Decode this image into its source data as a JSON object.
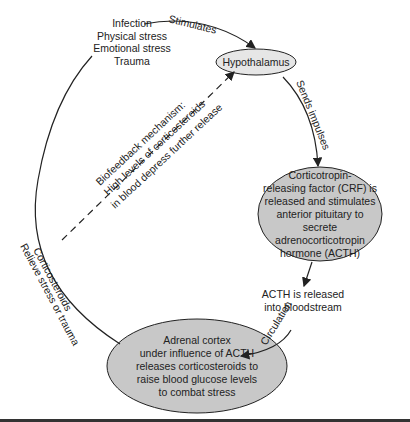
{
  "nodes": {
    "stressors": "Infection\nPhysical stress\nEmotional stress\nTrauma",
    "hypothalamus": "Hypothalamus",
    "crf": "Corticotropin-\nreleasing factor (CRF) is\nreleased and stimulates\nanterior pituitary to secrete\nadrenocorticotropin\nhormone (ACTH)",
    "acth_release": "ACTH is released\ninto bloodstream",
    "adrenal": "Adrenal cortex\nunder influence of ACTH\nreleases corticosteroids to\nraise blood glucose levels\nto combat stress"
  },
  "edges": {
    "stimulates": "Stimulates",
    "sends_impulses": "Sends impulses",
    "circulation": "Circulation",
    "relieve_line1": "Corticosteroids",
    "relieve_line2": "Relieve stress or trauma",
    "feedback_line1": "Biofeedback mechanism:",
    "feedback_line2": "High levels of corticosteroids",
    "feedback_line3": "in blood depress further release"
  },
  "colors": {
    "node_fill": "#c8c8c8",
    "node_fill_light": "#e6e6e6",
    "stroke": "#222222"
  }
}
